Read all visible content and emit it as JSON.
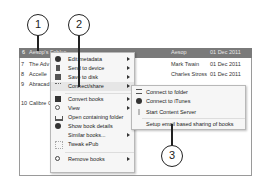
{
  "library": {
    "selected_row": {
      "num": "6",
      "title": "Aesop's Fables",
      "author": "Aesop",
      "date": "01 Dec 2011"
    },
    "rows": [
      {
        "num": "7",
        "title": "The Adv",
        "author": "Mark Twain",
        "date": "01 Dec 2011"
      },
      {
        "num": "8",
        "title": "Accelle",
        "author": "Charles Stross",
        "date": "01 Dec 2011"
      },
      {
        "num": "9",
        "title": "Abracad",
        "author": "",
        "date": ""
      },
      {
        "num": "10",
        "title": "Calibre C",
        "author": "",
        "date": ""
      }
    ]
  },
  "context_menu": {
    "items": [
      {
        "label": "Edit metadata",
        "icon": "info-icon",
        "submenu": true
      },
      {
        "label": "Send to device",
        "icon": "device-icon",
        "submenu": true
      },
      {
        "label": "Save to disk",
        "icon": "save-icon",
        "submenu": true
      },
      {
        "label": "Connect/share",
        "icon": "share-icon",
        "submenu": true
      },
      {
        "label": "Convert books",
        "icon": "convert-icon",
        "submenu": true
      },
      {
        "label": "View",
        "icon": "magnifier-icon",
        "submenu": true
      },
      {
        "label": "Open containing folder",
        "icon": "folder-icon",
        "submenu": false
      },
      {
        "label": "Show book details",
        "icon": "details-icon",
        "submenu": false
      },
      {
        "label": "Similar books...",
        "icon": "",
        "submenu": true
      },
      {
        "label": "Tweak ePub",
        "icon": "tweak-icon",
        "submenu": false
      },
      {
        "label": "Remove books",
        "icon": "remove-icon",
        "submenu": true
      }
    ]
  },
  "submenu": {
    "items": [
      {
        "label": "Connect to folder",
        "icon": "folder-connect-icon"
      },
      {
        "label": "Connect to iTunes",
        "icon": "itunes-icon"
      },
      {
        "label": "Start Content Server",
        "icon": "server-icon"
      },
      {
        "label": "Setup email based sharing of books",
        "icon": ""
      }
    ]
  },
  "callouts": [
    "1",
    "2",
    "3"
  ],
  "colors": {
    "selected_row_bg": "#7a7a7a",
    "menu_bg": "#f6f6f6",
    "frame_border": "#9a9a9a"
  }
}
